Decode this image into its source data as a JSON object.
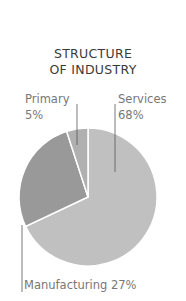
{
  "title_line1": "STRUCTURE",
  "title_line2": "OF INDUSTRY",
  "labels": {
    "primary_name": "Primary",
    "primary_value": "5%",
    "services_name": "Services",
    "services_value": "68%",
    "manufacturing": "Manufacturing 27%"
  },
  "colors": {
    "services": "#c0c0c0",
    "manufacturing": "#999999",
    "primary": "#b0b0b0",
    "leader": "#555555"
  },
  "chart_data": {
    "type": "pie",
    "categories": [
      "Services",
      "Manufacturing",
      "Primary"
    ],
    "values": [
      68,
      27,
      5
    ],
    "unit": "%",
    "start_angle": "12 o'clock, clockwise",
    "legend": "none (direct labels with leader lines)"
  }
}
